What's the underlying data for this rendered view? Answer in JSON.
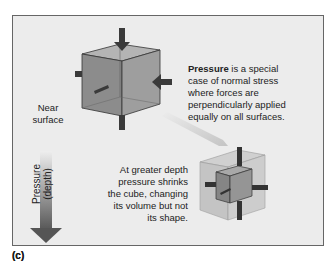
{
  "figure": {
    "panel_label": "(c)",
    "top_label": "(b)"
  },
  "annotations": {
    "pressure_term": "Pressure",
    "pressure_rest_line1": " is a special",
    "pressure_line2": "case of normal stress",
    "pressure_line3": "where forces are",
    "pressure_line4": "perpendicularly applied",
    "pressure_line5": "equally on all surfaces.",
    "depth_line1": "At greater depth",
    "depth_line2": "pressure shrinks",
    "depth_line3": "the cube, changing",
    "depth_line4": "its volume but not",
    "depth_line5": "its shape.",
    "near_line1": "Near",
    "near_line2": "surface",
    "axis_label": "Pressure (depth)"
  },
  "colors": {
    "panel_bg": "#ececec",
    "cube_face": "#8a8a8a",
    "arrow": "#3a3a3a",
    "gradient_top": "#e6e6e6",
    "gradient_bottom": "#555555"
  }
}
